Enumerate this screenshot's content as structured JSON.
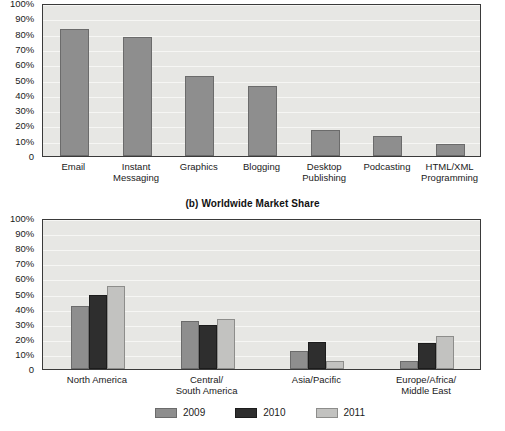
{
  "figure": {
    "panel_b_title": "(b) Worldwide Market Share"
  },
  "chart_data": [
    {
      "id": "panel-a",
      "type": "bar",
      "title": "",
      "xlabel": "",
      "ylabel": "",
      "ylim": [
        0,
        100
      ],
      "grid": true,
      "legend": "none",
      "ytick_labels": [
        "100%",
        "90%",
        "80%",
        "70%",
        "60%",
        "50%",
        "40%",
        "30%",
        "20%",
        "10%",
        "0"
      ],
      "ytick_values": [
        100,
        90,
        80,
        70,
        60,
        50,
        40,
        30,
        20,
        10,
        0
      ],
      "categories": [
        "Email",
        "Instant\nMessaging",
        "Graphics",
        "Blogging",
        "Desktop\nPublishing",
        "Podcasting",
        "HTML/XML\nProgramming"
      ],
      "values": [
        83,
        78,
        52,
        46,
        17,
        13,
        8
      ],
      "series_color": "#8e8e8e"
    },
    {
      "id": "panel-b",
      "type": "bar",
      "title": "(b) Worldwide Market Share",
      "xlabel": "",
      "ylabel": "",
      "ylim": [
        0,
        100
      ],
      "grid": true,
      "legend": "bottom-center",
      "ytick_labels": [
        "100%",
        "90%",
        "80%",
        "70%",
        "60%",
        "50%",
        "40%",
        "30%",
        "20%",
        "10%",
        "0"
      ],
      "ytick_values": [
        100,
        90,
        80,
        70,
        60,
        50,
        40,
        30,
        20,
        10,
        0
      ],
      "categories": [
        "North America",
        "Central/\nSouth America",
        "Asia/Pacific",
        "Europe/Africa/\nMiddle East"
      ],
      "series": [
        {
          "name": "2009",
          "color": "#8e8e8e",
          "values": [
            42,
            32,
            12,
            5
          ]
        },
        {
          "name": "2010",
          "color": "#2e2e2e",
          "values": [
            49,
            29,
            18,
            17
          ]
        },
        {
          "name": "2011",
          "color": "#c2c2c0",
          "values": [
            55,
            33,
            5,
            22
          ]
        }
      ]
    }
  ]
}
